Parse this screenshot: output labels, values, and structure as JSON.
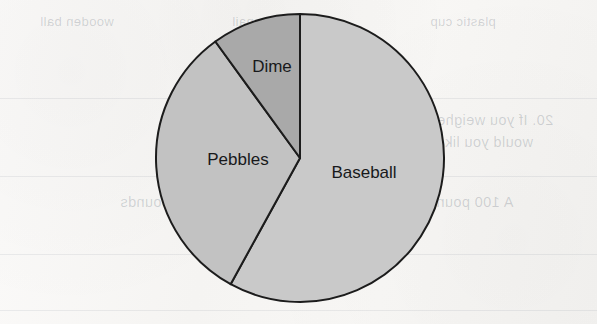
{
  "page": {
    "background_color": "#f5f4f2",
    "kind": "scanned-worksheet-page"
  },
  "background_bleed": {
    "description": "Mirrored text showing through from the reverse side of the scanned worksheet page",
    "lines": [
      {
        "text": "wooden ball",
        "x": 40,
        "y": 14,
        "size": "sm",
        "bold": false
      },
      {
        "text": "iron nail",
        "x": 232,
        "y": 14,
        "size": "sm",
        "bold": false
      },
      {
        "text": "plastic cup",
        "x": 430,
        "y": 14,
        "size": "sm",
        "bold": false
      },
      {
        "text": "20. If you weighed 75 pounds on Earth, how much",
        "x": 212,
        "y": 112,
        "size": "md",
        "bold": false
      },
      {
        "text": "would you likely weigh on the Moon? Explain",
        "x": 228,
        "y": 134,
        "size": "md",
        "bold": false
      },
      {
        "text": "your answer.",
        "x": 250,
        "y": 156,
        "size": "md",
        "bold": false
      },
      {
        "text": "A 100 pounds",
        "x": 420,
        "y": 194,
        "size": "md",
        "bold": false
      },
      {
        "text": "B 150 pounds",
        "x": 268,
        "y": 194,
        "size": "md",
        "bold": false
      },
      {
        "text": "C 40 pounds",
        "x": 120,
        "y": 194,
        "size": "md",
        "bold": false
      }
    ],
    "rules": [
      {
        "y": 98
      },
      {
        "y": 176
      },
      {
        "y": 254
      },
      {
        "y": 310
      }
    ]
  },
  "chart_data": {
    "type": "pie",
    "title": "",
    "xlabel": "",
    "ylabel": "",
    "legend_position": "none",
    "grid": false,
    "labels_inside_slices": true,
    "start_angle_deg": 0,
    "direction": "clockwise",
    "center": {
      "x": 300,
      "y": 158
    },
    "radius": 144,
    "categories": [
      "Baseball",
      "Pebbles",
      "Dime"
    ],
    "values": [
      58,
      32,
      10
    ],
    "value_unit": "percent",
    "slices": [
      {
        "label": "Baseball",
        "value": 58,
        "start_deg": 0,
        "end_deg": 208.8,
        "fill": "#c9c9c9",
        "stroke": "#1c1c1c",
        "label_x": 364,
        "label_y": 178
      },
      {
        "label": "Pebbles",
        "value": 32,
        "start_deg": 208.8,
        "end_deg": 324.0,
        "fill": "#c2c2c2",
        "stroke": "#1c1c1c",
        "label_x": 238,
        "label_y": 165
      },
      {
        "label": "Dime",
        "value": 10,
        "start_deg": 324.0,
        "end_deg": 360,
        "fill": "#a9a9a9",
        "stroke": "#1c1c1c",
        "label_x": 272,
        "label_y": 72
      }
    ]
  }
}
